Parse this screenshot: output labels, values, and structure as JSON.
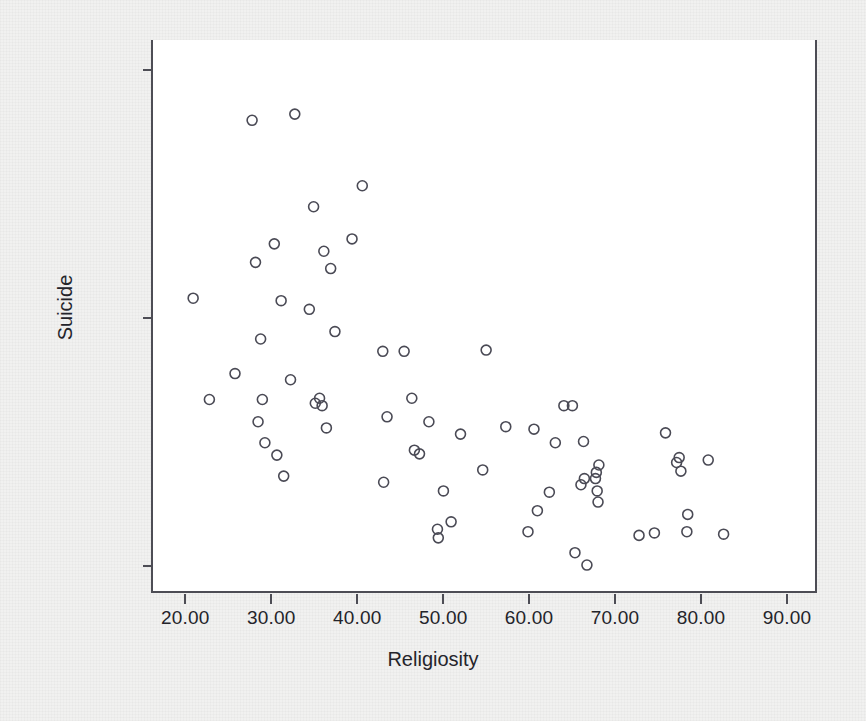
{
  "figure": {
    "background_color": "#f1f1f0",
    "plot_background_color": "#ffffff",
    "axis_color": "#4d4d55",
    "marker_color": "#4a4a55"
  },
  "chart_data": {
    "type": "scatter",
    "title": "",
    "xlabel": "Religiosity",
    "ylabel": "Suicide",
    "xlim": [
      16.0,
      93.5
    ],
    "ylim": [
      -2.2,
      42.4
    ],
    "xticks": [
      20.0,
      30.0,
      40.0,
      50.0,
      60.0,
      70.0,
      80.0,
      90.0
    ],
    "yticks": [
      0.0,
      20.0,
      40.0
    ],
    "xtick_labels": [
      "20.00",
      "30.00",
      "40.00",
      "50.00",
      "60.00",
      "70.00",
      "80.00",
      "90.00"
    ],
    "ytick_labels": [
      "0.00",
      "20.00",
      "40.00"
    ],
    "grid": false,
    "legend": null,
    "marker": "open-circle",
    "marker_size": 10,
    "n_points": 79,
    "points": [
      [
        20.7,
        21.5
      ],
      [
        22.6,
        13.3
      ],
      [
        25.6,
        15.4
      ],
      [
        27.6,
        35.9
      ],
      [
        28.0,
        24.4
      ],
      [
        28.3,
        11.5
      ],
      [
        28.6,
        18.2
      ],
      [
        28.8,
        13.3
      ],
      [
        29.1,
        9.8
      ],
      [
        30.2,
        25.9
      ],
      [
        30.5,
        8.8
      ],
      [
        31.0,
        21.3
      ],
      [
        31.3,
        7.1
      ],
      [
        32.1,
        14.9
      ],
      [
        32.6,
        36.4
      ],
      [
        34.3,
        20.6
      ],
      [
        34.8,
        28.9
      ],
      [
        35.0,
        13.0
      ],
      [
        35.5,
        13.4
      ],
      [
        35.8,
        12.8
      ],
      [
        36.0,
        25.3
      ],
      [
        36.3,
        11.0
      ],
      [
        36.8,
        23.9
      ],
      [
        37.3,
        18.8
      ],
      [
        39.3,
        26.3
      ],
      [
        40.5,
        30.6
      ],
      [
        42.9,
        17.2
      ],
      [
        43.0,
        6.6
      ],
      [
        43.4,
        11.9
      ],
      [
        45.4,
        17.2
      ],
      [
        46.3,
        13.4
      ],
      [
        46.6,
        9.2
      ],
      [
        47.2,
        8.9
      ],
      [
        48.3,
        11.5
      ],
      [
        49.3,
        2.8
      ],
      [
        49.4,
        2.1
      ],
      [
        50.0,
        5.9
      ],
      [
        50.9,
        3.4
      ],
      [
        52.0,
        10.5
      ],
      [
        54.6,
        7.6
      ],
      [
        55.0,
        17.3
      ],
      [
        57.3,
        11.1
      ],
      [
        59.9,
        2.6
      ],
      [
        60.6,
        10.9
      ],
      [
        61.0,
        4.3
      ],
      [
        62.4,
        5.8
      ],
      [
        63.1,
        9.8
      ],
      [
        64.1,
        12.8
      ],
      [
        65.1,
        12.8
      ],
      [
        65.4,
        0.9
      ],
      [
        66.1,
        6.4
      ],
      [
        66.4,
        9.9
      ],
      [
        66.5,
        6.9
      ],
      [
        66.8,
        -0.1
      ],
      [
        67.8,
        6.9
      ],
      [
        67.9,
        7.4
      ],
      [
        68.0,
        5.9
      ],
      [
        68.1,
        5.0
      ],
      [
        68.2,
        8.0
      ],
      [
        72.9,
        2.3
      ],
      [
        74.7,
        2.5
      ],
      [
        76.0,
        10.6
      ],
      [
        77.3,
        8.2
      ],
      [
        77.6,
        8.6
      ],
      [
        77.8,
        7.5
      ],
      [
        78.5,
        2.6
      ],
      [
        78.6,
        4.0
      ],
      [
        81.0,
        8.4
      ],
      [
        82.8,
        2.4
      ]
    ]
  }
}
